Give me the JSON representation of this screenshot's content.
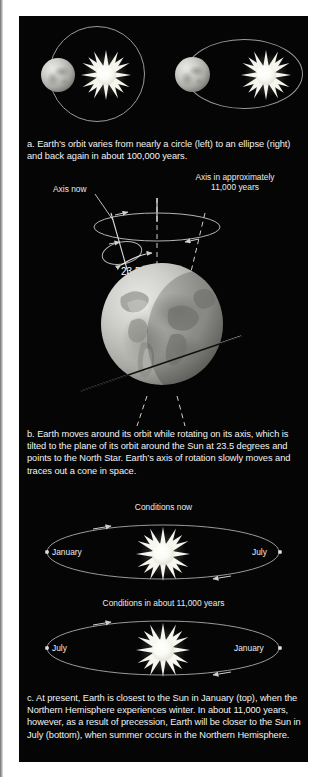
{
  "figure": {
    "background_color": "#050505",
    "text_color": "#f2f2f2",
    "line_color": "#9a9a9a"
  },
  "panel_a": {
    "caption_lines": [
      "a. Earth’s orbit varies from nearly a circle (left) to an ellipse (right)",
      "and back again in about 100,000 years."
    ],
    "left_diagram": {
      "orbit_shape": "circle",
      "sun": "sun-star",
      "earth": "earth-sphere"
    },
    "right_diagram": {
      "orbit_shape": "ellipse",
      "sun": "sun-star",
      "earth": "earth-sphere"
    }
  },
  "panel_b": {
    "label_axis_now": "Axis now",
    "label_axis_future_line1": "Axis in approximately",
    "label_axis_future_line2": "11,000 years",
    "label_tilt_angle": "23.5",
    "caption_lines": [
      "b. Earth moves around its orbit while rotating on its axis, which is",
      "tilted to the plane of its orbit around the Sun at 23.5 degrees and",
      "points to the North Star. Earth’s axis of rotation slowly moves and",
      "traces out a cone in space."
    ]
  },
  "panel_c": {
    "top_title": "Conditions now",
    "top_left_label": "January",
    "top_right_label": "July",
    "bottom_title": "Conditions in about 11,000 years",
    "bottom_left_label": "July",
    "bottom_right_label": "January",
    "caption_lines": [
      "c. At present, Earth is closest to the Sun in January (top), when the",
      "Northern Hemisphere experiences winter. In about 11,000 years,",
      "however, as a result of precession, Earth will be closer to the Sun in",
      "July (bottom), when summer occurs in the Northern Hemisphere."
    ]
  }
}
